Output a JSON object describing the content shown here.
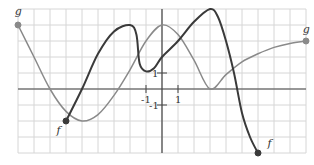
{
  "chart_data": {
    "type": "line",
    "title": "",
    "xlabel": "",
    "ylabel": "",
    "xlim": [
      -9,
      9
    ],
    "ylim": [
      -4,
      5
    ],
    "grid": true,
    "grid_step": 1,
    "tick_labels": {
      "x": [
        {
          "value": -1,
          "label": "-1"
        },
        {
          "value": 1,
          "label": "1"
        }
      ],
      "y": [
        {
          "value": 1,
          "label": "1"
        },
        {
          "value": -1,
          "label": "-1"
        }
      ]
    },
    "series": [
      {
        "name": "f",
        "color": "#3a3a3a",
        "width": 2,
        "points": [
          [
            -6,
            -2
          ],
          [
            -5,
            0
          ],
          [
            -4,
            2.2
          ],
          [
            -3,
            3.6
          ],
          [
            -2,
            4
          ],
          [
            -1.6,
            3.4
          ],
          [
            -1.4,
            1.6
          ],
          [
            -1,
            1.1
          ],
          [
            -0.5,
            1.3
          ],
          [
            0,
            2
          ],
          [
            1,
            3
          ],
          [
            2,
            4.2
          ],
          [
            3,
            5
          ],
          [
            3.5,
            4.5
          ],
          [
            4,
            3
          ],
          [
            4.5,
            1
          ],
          [
            5,
            -1.5
          ],
          [
            5.5,
            -3
          ],
          [
            6,
            -4
          ]
        ],
        "endpoints": [
          {
            "x": -6,
            "y": -2,
            "filled": true
          },
          {
            "x": 6,
            "y": -4,
            "filled": true
          }
        ],
        "label_positions": [
          {
            "x": -6.6,
            "y": -2.8
          },
          {
            "x": 6.6,
            "y": -3.6
          }
        ]
      },
      {
        "name": "g",
        "color": "#8a8a8a",
        "width": 1.5,
        "points": [
          [
            -9,
            4
          ],
          [
            -8,
            2
          ],
          [
            -7,
            0
          ],
          [
            -6,
            -1.4
          ],
          [
            -5,
            -2
          ],
          [
            -4,
            -1.6
          ],
          [
            -3,
            -0.4
          ],
          [
            -2,
            1.2
          ],
          [
            -1,
            3
          ],
          [
            0,
            4
          ],
          [
            1,
            3.4
          ],
          [
            2,
            1.8
          ],
          [
            3,
            0
          ],
          [
            4,
            0.9
          ],
          [
            5,
            1.7
          ],
          [
            6,
            2.2
          ],
          [
            7,
            2.6
          ],
          [
            8,
            2.85
          ],
          [
            9,
            3
          ]
        ],
        "endpoints": [
          {
            "x": -9,
            "y": 4,
            "filled": true
          },
          {
            "x": 9,
            "y": 3,
            "filled": true
          }
        ],
        "label_positions": [
          {
            "x": -9.2,
            "y": 4.6
          },
          {
            "x": 8.8,
            "y": 3.5
          }
        ]
      }
    ],
    "legend": []
  }
}
